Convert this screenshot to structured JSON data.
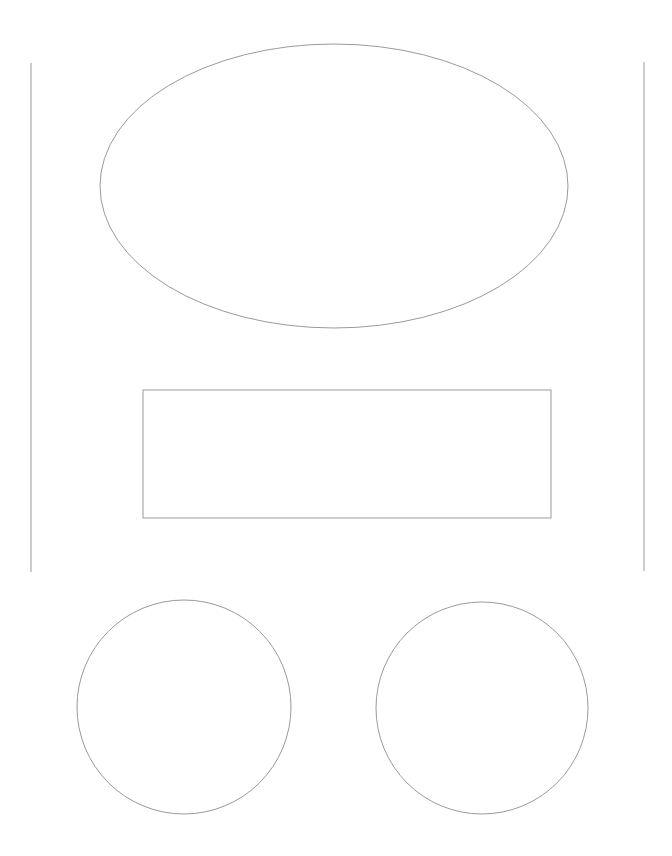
{
  "canvas": {
    "width": 672,
    "height": 856,
    "background": "#ffffff"
  },
  "stroke": {
    "color": "#9a9a9a",
    "width": 1
  },
  "shapes": {
    "left_line": {
      "x1": 31,
      "y1": 63,
      "x2": 31,
      "y2": 572
    },
    "right_line": {
      "x1": 644,
      "y1": 62,
      "x2": 644,
      "y2": 571
    },
    "ellipse": {
      "cx": 334,
      "cy": 186,
      "rx": 234,
      "ry": 142
    },
    "rectangle": {
      "x": 143,
      "y": 390,
      "width": 408,
      "height": 128
    },
    "left_circle": {
      "cx": 184,
      "cy": 707,
      "r": 107
    },
    "right_circle": {
      "cx": 482,
      "cy": 708,
      "r": 106
    }
  }
}
